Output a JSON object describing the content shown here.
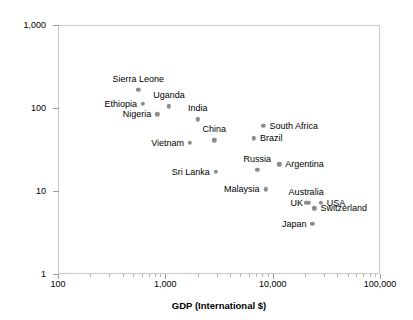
{
  "chart_data": {
    "type": "scatter",
    "title": "",
    "xlabel": "GDP (International $)",
    "ylabel": "Infant mortality (per 1,000 live births)",
    "xscale": "log",
    "yscale": "log",
    "xlim": [
      100,
      100000
    ],
    "ylim": [
      1,
      1000
    ],
    "grid": false,
    "legend": "none",
    "marker_color": "#8c8c8c",
    "frame_color": "#c9c9c9",
    "x_tick_labels": [
      "100",
      "1,000",
      "10,000",
      "100,000"
    ],
    "x_tick_values": [
      100,
      1000,
      10000,
      100000
    ],
    "y_tick_labels": [
      "1,000",
      "100",
      "10",
      "1"
    ],
    "y_tick_values": [
      1000,
      100,
      10,
      1
    ],
    "points": [
      {
        "name": "Sierra Leone",
        "gdp": 560,
        "mortality": 165,
        "label_pos": "above"
      },
      {
        "name": "Ethiopia",
        "gdp": 620,
        "mortality": 113,
        "label_pos": "left"
      },
      {
        "name": "Nigeria",
        "gdp": 840,
        "mortality": 84,
        "label_pos": "left"
      },
      {
        "name": "Uganda",
        "gdp": 1080,
        "mortality": 105,
        "label_pos": "above"
      },
      {
        "name": "India",
        "gdp": 2000,
        "mortality": 73,
        "label_pos": "above"
      },
      {
        "name": "Vietnam",
        "gdp": 1700,
        "mortality": 38,
        "label_pos": "left"
      },
      {
        "name": "China",
        "gdp": 2850,
        "mortality": 41,
        "label_pos": "above"
      },
      {
        "name": "Sri Lanka",
        "gdp": 2950,
        "mortality": 17,
        "label_pos": "left"
      },
      {
        "name": "Brazil",
        "gdp": 6700,
        "mortality": 43,
        "label_pos": "right"
      },
      {
        "name": "South Africa",
        "gdp": 8200,
        "mortality": 61,
        "label_pos": "right"
      },
      {
        "name": "Russia",
        "gdp": 7200,
        "mortality": 18,
        "label_pos": "above"
      },
      {
        "name": "Malaysia",
        "gdp": 8600,
        "mortality": 10.5,
        "label_pos": "left"
      },
      {
        "name": "Argentina",
        "gdp": 11500,
        "mortality": 21,
        "label_pos": "right"
      },
      {
        "name": "Australia",
        "gdp": 20500,
        "mortality": 7.2,
        "label_pos": "above"
      },
      {
        "name": "UK",
        "gdp": 21800,
        "mortality": 7.2,
        "label_pos": "left"
      },
      {
        "name": "USA",
        "gdp": 28000,
        "mortality": 7.2,
        "label_pos": "right"
      },
      {
        "name": "Switzerland",
        "gdp": 24500,
        "mortality": 6.2,
        "label_pos": "right"
      },
      {
        "name": "Japan",
        "gdp": 23500,
        "mortality": 4.0,
        "label_pos": "left"
      }
    ]
  }
}
